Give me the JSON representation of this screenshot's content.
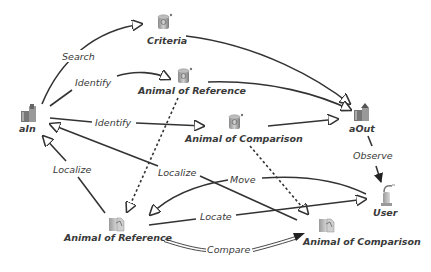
{
  "diagram": {
    "nodes": {
      "ain": {
        "label": "aIn",
        "icon": "input-icon"
      },
      "aout": {
        "label": "aOut",
        "icon": "output-icon"
      },
      "criteria": {
        "label": "Criteria",
        "icon": "database-icon"
      },
      "ref_top": {
        "label": "Animal of Reference",
        "icon": "database-icon"
      },
      "cmp_top": {
        "label": "Animal of Comparison",
        "icon": "database-icon"
      },
      "user": {
        "label": "User",
        "icon": "user-icon"
      },
      "ref_bottom": {
        "label": "Animal of Reference",
        "icon": "document-icon"
      },
      "cmp_bottom": {
        "label": "Animal of Comparison",
        "icon": "document-icon"
      }
    },
    "edges": {
      "search": {
        "label": "Search",
        "from": "aIn",
        "to": "Criteria"
      },
      "identify_ref": {
        "label": "Identify",
        "from": "aIn",
        "to": "Animal of Reference"
      },
      "identify_cmp": {
        "label": "Identify",
        "from": "aIn",
        "to": "Animal of Comparison"
      },
      "observe": {
        "label": "Observe",
        "from": "aOut",
        "to": "User"
      },
      "localize_left": {
        "label": "Localize",
        "from": "Animal of Reference (document)",
        "to": "aIn"
      },
      "localize_right": {
        "label": "Localize",
        "from": "Animal of Comparison (document)",
        "to": "aIn"
      },
      "move": {
        "label": "Move",
        "from": "User",
        "to": "Animal of Reference (document)"
      },
      "locate": {
        "label": "Locate",
        "from": "Animal of Reference (document)",
        "to": "User"
      },
      "compare": {
        "label": "Compare",
        "from": "Animal of Reference (document)",
        "to": "Animal of Comparison (document)"
      }
    }
  }
}
